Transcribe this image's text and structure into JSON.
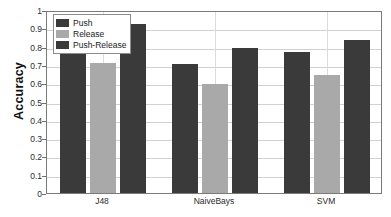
{
  "chart_data": {
    "type": "bar",
    "title": "",
    "xlabel": "",
    "ylabel": "Accuracy",
    "categories": [
      "J48",
      "NaiveBays",
      "SVM"
    ],
    "series": [
      {
        "name": "Push",
        "color": "#3a3a3a",
        "values": [
          0.795,
          0.705,
          0.772
        ]
      },
      {
        "name": "Release",
        "color": "#a9a9a9",
        "values": [
          0.71,
          0.595,
          0.643
        ]
      },
      {
        "name": "Push-Release",
        "color": "#3a3a3a",
        "values": [
          0.925,
          0.79,
          0.838
        ]
      }
    ],
    "ylim": [
      0,
      1
    ],
    "yticks": [
      "0",
      "0.1",
      "0.2",
      "0.3",
      "0.4",
      "0.5",
      "0.6",
      "0.7",
      "0.8",
      "0.9",
      "1"
    ],
    "ytick_values": [
      0,
      0.1,
      0.2,
      0.3,
      0.4,
      0.5,
      0.6,
      0.7,
      0.8,
      0.9,
      1
    ],
    "grid": true,
    "grid_axis": "both",
    "legend_position": "top-left-inside"
  },
  "figure": {
    "background": "#ffffff",
    "axis_color": "#7a7a7a",
    "grid_color": "#d2d2d2"
  }
}
